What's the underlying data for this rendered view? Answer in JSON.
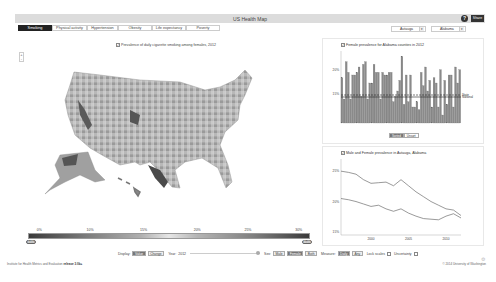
{
  "header": {
    "title": "US Health Map",
    "help": "?",
    "share_label": "Share"
  },
  "tabs": [
    {
      "label": "Smoking",
      "active": true
    },
    {
      "label": "Physical activity"
    },
    {
      "label": "Hypertension"
    },
    {
      "label": "Obesity"
    },
    {
      "label": "Life expectancy"
    },
    {
      "label": "Poverty"
    }
  ],
  "selects": {
    "county": "Autauga",
    "state": "Alabama"
  },
  "map": {
    "title": "Prevalence of daily cigarette smoking among females, 2012",
    "zoom_in": "+",
    "zoom_out": "-"
  },
  "legend": {
    "ticks": [
      "0%",
      "10%",
      "15%",
      "20%",
      "25%",
      "30%"
    ],
    "min_handle": "0.0%",
    "max_handle": "30.0%"
  },
  "panel1": {
    "title": "Female prevalence for Alabama counties in 2012",
    "toggle": [
      "Sorted",
      "Unsort"
    ],
    "state_label": "State",
    "national_label": "National"
  },
  "panel2": {
    "title": "Male and Female prevalence in Autauga, Alabama"
  },
  "controls": {
    "display_label": "Display:",
    "display_opts": [
      "Value",
      "Change"
    ],
    "year_label": "Year:",
    "year": "2012",
    "sex_label": "Sex:",
    "sex_opts": [
      "Male",
      "Female",
      "Both"
    ],
    "measure_label": "Measure:",
    "measure_opts": [
      "Daily",
      "Any"
    ],
    "lock_label": "Lock scales",
    "uncert_label": "Uncertainty"
  },
  "footer": {
    "left": "Institute for Health Metrics and Evaluation",
    "left_link": "release 3.0b+",
    "right": "© 2014 University of Washington"
  },
  "chart_data": [
    {
      "type": "bar",
      "title": "Female prevalence for Alabama counties in 2012",
      "ylabel": "",
      "ylim": [
        0,
        27
      ],
      "yticks": [
        "15%",
        "20%"
      ],
      "values": [
        17,
        9,
        23,
        19,
        9,
        18,
        18,
        19,
        21,
        10,
        22,
        23,
        9,
        15,
        15,
        22,
        19,
        19,
        9,
        19,
        18,
        18,
        19,
        19,
        8,
        10,
        12,
        16,
        25,
        7,
        18,
        8,
        18,
        6,
        6,
        8,
        5,
        19,
        14,
        21,
        12,
        16,
        6,
        17,
        15,
        6,
        20,
        3,
        16,
        7,
        18,
        18,
        6,
        21,
        15,
        20
      ],
      "reference_lines": [
        {
          "name": "State",
          "value": 13.5
        },
        {
          "name": "National",
          "value": 10.5
        }
      ]
    },
    {
      "type": "line",
      "title": "Male and Female prevalence in Autauga, Alabama",
      "x": [
        1996,
        1997,
        1998,
        1999,
        2000,
        2001,
        2002,
        2003,
        2004,
        2005,
        2006,
        2007,
        2008,
        2009,
        2010,
        2011,
        2012
      ],
      "series": [
        {
          "name": "Male",
          "values": [
            25,
            24.8,
            24.5,
            23.6,
            23,
            23.1,
            23.2,
            22.6,
            23.6,
            22.6,
            21.6,
            20.8,
            20,
            19.4,
            18.8,
            18.6,
            17.7
          ]
        },
        {
          "name": "Female",
          "values": [
            20.5,
            20.3,
            20,
            19.6,
            19.2,
            19.4,
            18.8,
            18.4,
            18.8,
            18.1,
            17.6,
            17.2,
            17.1,
            17,
            17.6,
            18,
            17.3
          ]
        }
      ],
      "yticks": [
        "15%",
        "20%",
        "25%"
      ],
      "xticks": [
        "2000",
        "2005",
        "2010"
      ],
      "ylim": [
        14.5,
        27
      ]
    }
  ]
}
